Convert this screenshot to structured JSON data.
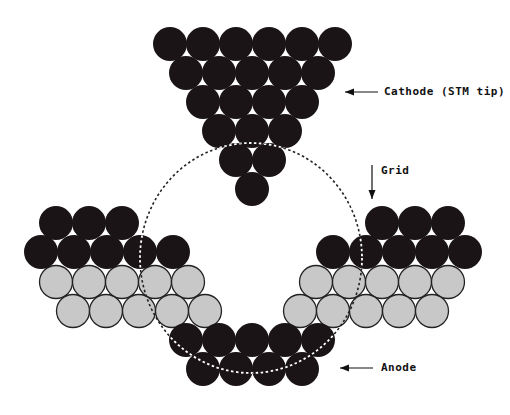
{
  "diagram": {
    "colors": {
      "background": "#ffffff",
      "atom_dark": "#1a1416",
      "atom_gray": "#c8c8c8",
      "atom_outline": "#222222",
      "grid_dash_on_light": "#222222",
      "grid_dash_on_dark": "#ffffff"
    },
    "atom_radius": 17,
    "grid": {
      "cx": 251,
      "cy": 258,
      "rx": 111,
      "ry": 115
    },
    "clusters": {
      "cathode": {
        "color": "dark",
        "rows": [
          {
            "y": 44,
            "xs": [
              170,
              203,
              236,
              269,
              302,
              335
            ]
          },
          {
            "y": 73,
            "xs": [
              186,
              219,
              252,
              285,
              318
            ]
          },
          {
            "y": 102,
            "xs": [
              203,
              236,
              269,
              302
            ]
          },
          {
            "y": 131,
            "xs": [
              219,
              252,
              285
            ]
          },
          {
            "y": 160,
            "xs": [
              236,
              269
            ]
          },
          {
            "y": 189,
            "xs": [
              252
            ]
          }
        ]
      },
      "left_electrode": {
        "rows": [
          {
            "color": "dark",
            "y": 223,
            "xs": [
              56,
              89,
              122
            ]
          },
          {
            "color": "dark",
            "y": 252,
            "xs": [
              41,
              74,
              107,
              140,
              173
            ]
          },
          {
            "color": "gray",
            "y": 282,
            "xs": [
              56,
              89,
              122,
              155,
              188
            ]
          },
          {
            "color": "gray",
            "y": 311,
            "xs": [
              73,
              106,
              139,
              172,
              205
            ]
          }
        ]
      },
      "right_electrode": {
        "rows": [
          {
            "color": "dark",
            "y": 223,
            "xs": [
              382,
              415,
              448
            ]
          },
          {
            "color": "dark",
            "y": 252,
            "xs": [
              333,
              366,
              399,
              432,
              465
            ]
          },
          {
            "color": "gray",
            "y": 282,
            "xs": [
              316,
              349,
              382,
              415,
              448
            ]
          },
          {
            "color": "gray",
            "y": 311,
            "xs": [
              300,
              333,
              366,
              399,
              432
            ]
          }
        ]
      },
      "anode": {
        "color": "dark",
        "rows": [
          {
            "y": 340,
            "xs": [
              186,
              219,
              252,
              285,
              318
            ]
          },
          {
            "y": 369,
            "xs": [
              203,
              236,
              269,
              302
            ]
          }
        ]
      }
    },
    "labels": {
      "cathode": "Cathode (STM tip)",
      "grid": "Grid",
      "anode": "Anode"
    },
    "arrows": {
      "cathode": {
        "x1": 378,
        "y1": 92,
        "x2": 345,
        "y2": 92,
        "direction": "left"
      },
      "grid": {
        "x1": 372,
        "y1": 165,
        "x2": 372,
        "y2": 199,
        "direction": "down"
      },
      "anode": {
        "x1": 373,
        "y1": 368,
        "x2": 340,
        "y2": 368,
        "direction": "left"
      }
    }
  }
}
